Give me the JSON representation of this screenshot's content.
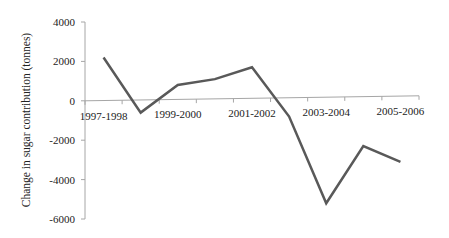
{
  "chart_data": {
    "type": "line",
    "title": "",
    "xlabel": "",
    "ylabel": "Change in sugar contribution (tonnes)",
    "categories": [
      "1997-1998",
      "1998-1999",
      "1999-2000",
      "2000-2001",
      "2001-2002",
      "2002-2003",
      "2003-2004",
      "2004-2005",
      "2005-2006"
    ],
    "visible_category_labels": [
      "1997-1998",
      "",
      "1999-2000",
      "",
      "2001-2002",
      "",
      "2003-2004",
      "",
      "2005-2006"
    ],
    "series": [
      {
        "name": "Change in sugar contribution",
        "values": [
          2200,
          -600,
          800,
          1100,
          1700,
          -800,
          -5200,
          -2300,
          -3100
        ],
        "color": "#595959"
      }
    ],
    "ylim": [
      -6000,
      4000
    ],
    "yticks": [
      4000,
      2000,
      0,
      -2000,
      -4000,
      -6000
    ],
    "grid": false,
    "legend": "none"
  }
}
